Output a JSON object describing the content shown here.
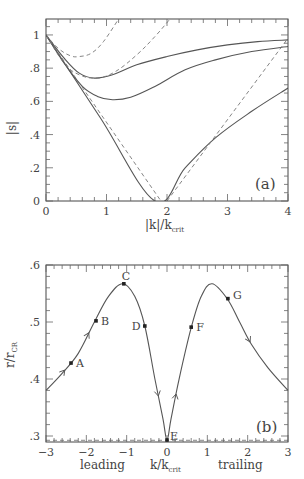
{
  "chart_data": [
    {
      "id": "a",
      "type": "line",
      "panel_label": "(a)",
      "xlabel": "|k|/k",
      "xlabel_sub": "crit",
      "ylabel": "|s|",
      "xlim": [
        0,
        4
      ],
      "ylim": [
        0,
        1.096
      ],
      "xticks": [
        0,
        1,
        2,
        3,
        4
      ],
      "xtick_labels": [
        "0",
        "1",
        "2",
        "3",
        "4"
      ],
      "yticks": [
        0,
        0.2,
        0.4,
        0.6,
        0.8,
        1.0
      ],
      "ytick_labels": [
        "0",
        ".2",
        ".4",
        ".6",
        ".8",
        "1"
      ],
      "grid": false,
      "series": [
        {
          "name": "solid-1",
          "style": "solid",
          "points": [
            [
              0,
              1
            ],
            [
              0.3,
              0.86
            ],
            [
              0.55,
              0.77
            ],
            [
              0.8,
              0.74
            ],
            [
              1.1,
              0.76
            ],
            [
              1.5,
              0.82
            ],
            [
              2,
              0.87
            ],
            [
              2.5,
              0.91
            ],
            [
              3,
              0.94
            ],
            [
              3.5,
              0.96
            ],
            [
              4,
              0.97
            ]
          ]
        },
        {
          "name": "solid-2",
          "style": "solid",
          "points": [
            [
              0,
              1
            ],
            [
              0.3,
              0.83
            ],
            [
              0.6,
              0.69
            ],
            [
              0.85,
              0.63
            ],
            [
              1.1,
              0.61
            ],
            [
              1.4,
              0.625
            ],
            [
              1.8,
              0.69
            ],
            [
              2.3,
              0.79
            ],
            [
              2.8,
              0.85
            ],
            [
              3.4,
              0.9
            ],
            [
              4,
              0.93
            ]
          ]
        },
        {
          "name": "solid-3",
          "style": "solid",
          "points": [
            [
              0,
              1
            ],
            [
              0.9,
              0.5
            ],
            [
              1.8,
              0
            ],
            [
              2.3,
              0.2
            ],
            [
              2.8,
              0.38
            ],
            [
              3.4,
              0.54
            ],
            [
              4,
              0.68
            ]
          ]
        },
        {
          "name": "dashed-1",
          "style": "dashed",
          "points": [
            [
              0,
              1
            ],
            [
              0.2,
              0.92
            ],
            [
              0.4,
              0.875
            ],
            [
              0.55,
              0.87
            ],
            [
              0.75,
              0.89
            ],
            [
              0.95,
              0.96
            ],
            [
              1.2,
              1.096
            ]
          ]
        },
        {
          "name": "dashed-2",
          "style": "dashed",
          "points": [
            [
              0,
              1
            ],
            [
              0.3,
              0.83
            ],
            [
              0.55,
              0.76
            ],
            [
              0.85,
              0.74
            ],
            [
              1.15,
              0.78
            ],
            [
              1.5,
              0.88
            ],
            [
              1.8,
              0.99
            ],
            [
              2.05,
              1.096
            ]
          ]
        },
        {
          "name": "dashed-3a",
          "style": "dashed-linear",
          "points": [
            [
              0,
              1
            ],
            [
              1.9,
              0
            ]
          ]
        },
        {
          "name": "dashed-3b",
          "style": "dashed-linear",
          "points": [
            [
              2.0,
              0
            ],
            [
              4,
              0.98
            ]
          ]
        }
      ]
    },
    {
      "id": "b",
      "type": "line",
      "panel_label": "(b)",
      "xlabel": "k/k",
      "xlabel_sub": "crit",
      "xlabel_left": "leading",
      "xlabel_right": "trailing",
      "ylabel": "r/r",
      "ylabel_sub": "CR",
      "xlim": [
        -3,
        3
      ],
      "ylim": [
        0.2895,
        0.6
      ],
      "xticks": [
        -3,
        -2,
        -1,
        0,
        1,
        2,
        3
      ],
      "xtick_labels": [
        "−3",
        "−2",
        "−1",
        "0",
        "1",
        "2",
        "3"
      ],
      "yticks": [
        0.3,
        0.4,
        0.5,
        0.6
      ],
      "ytick_labels": [
        ".3",
        ".4",
        ".5",
        ".6"
      ],
      "grid": false,
      "hline": {
        "y": 0.2925,
        "style": "dashed"
      },
      "series": [
        {
          "name": "trajectory",
          "style": "solid",
          "points": [
            [
              -3,
              0.38
            ],
            [
              -2.6,
              0.41
            ],
            [
              -2.2,
              0.445
            ],
            [
              -1.8,
              0.5
            ],
            [
              -1.45,
              0.545
            ],
            [
              -1.1,
              0.567
            ],
            [
              -0.8,
              0.545
            ],
            [
              -0.55,
              0.493
            ],
            [
              -0.3,
              0.4
            ],
            [
              -0.1,
              0.33
            ],
            [
              0,
              0.293
            ],
            [
              0.1,
              0.33
            ],
            [
              0.3,
              0.4
            ],
            [
              0.6,
              0.49
            ],
            [
              0.85,
              0.545
            ],
            [
              1.12,
              0.567
            ],
            [
              1.5,
              0.54
            ],
            [
              1.8,
              0.5
            ],
            [
              2.1,
              0.46
            ],
            [
              2.5,
              0.42
            ],
            [
              3,
              0.38
            ]
          ]
        }
      ],
      "points": [
        {
          "label": "A",
          "x": -2.38,
          "y": 0.428
        },
        {
          "label": "B",
          "x": -1.76,
          "y": 0.502
        },
        {
          "label": "C",
          "x": -1.07,
          "y": 0.567
        },
        {
          "label": "D",
          "x": -0.55,
          "y": 0.493
        },
        {
          "label": "E",
          "x": 0.0,
          "y": 0.293
        },
        {
          "label": "F",
          "x": 0.6,
          "y": 0.491
        },
        {
          "label": "G",
          "x": 1.51,
          "y": 0.541
        }
      ],
      "arrows": [
        {
          "x": -1.95,
          "direction": "up"
        },
        {
          "x": -2.55,
          "direction": "up"
        },
        {
          "x": -0.22,
          "direction": "down"
        },
        {
          "x": 0.22,
          "direction": "up"
        },
        {
          "x": 2.05,
          "direction": "down"
        }
      ]
    }
  ]
}
